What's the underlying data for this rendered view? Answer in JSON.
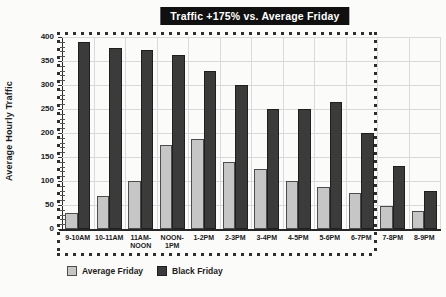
{
  "title": "Traffic +175% vs. Average Friday",
  "chart_data": {
    "type": "bar",
    "title": "Traffic +175% vs. Average Friday",
    "ylabel": "Average Hourly Traffic",
    "xlabel": "",
    "ylim": [
      0,
      400
    ],
    "ytick_step": 50,
    "grid": true,
    "legend_position": "bottom-left",
    "categories": [
      "9-10AM",
      "10-11AM",
      "11AM-NOON",
      "NOON-1PM",
      "1-2PM",
      "2-3PM",
      "3-4PM",
      "4-5PM",
      "5-6PM",
      "6-7PM",
      "7-8PM",
      "8-9PM"
    ],
    "category_display": [
      [
        "9-10AM"
      ],
      [
        "10-11AM"
      ],
      [
        "11AM-",
        "NOON"
      ],
      [
        "NOON-",
        "1PM"
      ],
      [
        "1-2PM"
      ],
      [
        "2-3PM"
      ],
      [
        "3-4PM"
      ],
      [
        "4-5PM"
      ],
      [
        "5-6PM"
      ],
      [
        "6-7PM"
      ],
      [
        "7-8PM"
      ],
      [
        "8-9PM"
      ]
    ],
    "series": [
      {
        "name": "Average Friday",
        "color": "#c6c6c6",
        "border_color": "#4d4d4d",
        "values": [
          33,
          68,
          100,
          176,
          188,
          139,
          126,
          100,
          88,
          75,
          48,
          38
        ]
      },
      {
        "name": "Black Friday",
        "color": "#3b3b3b",
        "border_color": "#1f1f1f",
        "values": [
          390,
          378,
          372,
          362,
          330,
          300,
          251,
          250,
          264,
          200,
          132,
          80
        ]
      }
    ],
    "annotations": {
      "highlight_box": {
        "style": "dotted",
        "from_category": "9-10AM",
        "to_category": "6-7PM"
      }
    }
  },
  "colors": {
    "page_bg": "#fbfbfa",
    "title_bg": "#101010",
    "title_text": "#ffffff",
    "gridline": "#dadada",
    "axis": "#262626",
    "dotted_box": "#2e2e2e"
  }
}
